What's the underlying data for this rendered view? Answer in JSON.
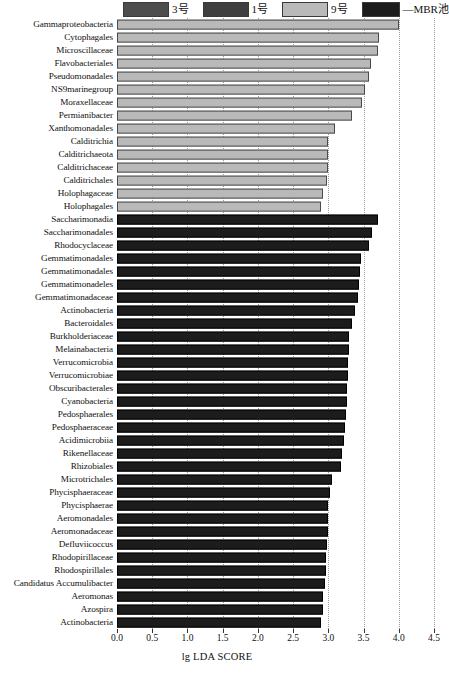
{
  "legend": {
    "items": [
      {
        "label": "3号",
        "color": "#4d4d4d"
      },
      {
        "label": "1号",
        "color": "#3f3f3f"
      },
      {
        "label": "9号",
        "color": "#b9b9b9"
      },
      {
        "label": "—MBR池",
        "color": "#1c1c1c"
      }
    ]
  },
  "axis": {
    "title": "lg LDA SCORE",
    "ticks": [
      "0.0",
      "0.5",
      "1.0",
      "1.5",
      "2.0",
      "2.5",
      "3.0",
      "3.5",
      "4.0",
      "4.5"
    ]
  },
  "footer_artifact": "",
  "chart_data": {
    "type": "bar",
    "orientation": "horizontal",
    "title": "",
    "xlabel": "lg LDA SCORE",
    "ylabel": "",
    "xlim": [
      0.0,
      4.5
    ],
    "grid": true,
    "legend_position": "top",
    "tick_step": 0.5,
    "series": [
      {
        "name": "9号",
        "color": "#b9b9b9"
      },
      {
        "name": "—MBR池",
        "color": "#1c1c1c"
      }
    ],
    "categories": [
      "Gammaproteobacteria",
      "Cytophagales",
      "Microscillaceae",
      "Flavobacteriales",
      "Pseudomonadales",
      "NS9marinegroup",
      "Moraxellaceae",
      "Permianibacter",
      "Xanthomonadales",
      "Calditrichia",
      "Calditrichaeota",
      "Calditrichaceae",
      "Calditrichales",
      "Holophagaceae",
      "Holophagales",
      "Saccharimonadia",
      "Saccharimonadales",
      "Rhodocyclaceae",
      "Gemmatimonadales",
      "Gemmatimonadales",
      "Gemmatimonadeles",
      "Gemmatimonadaceae",
      "Actinobacteria",
      "Bacteroidales",
      "Burkholderiaceae",
      "Melainabacteria",
      "Verrucomicrobia",
      "Verrucomicrobiae",
      "Obscuribacterales",
      "Cyanobacteria",
      "Pedosphaerales",
      "Pedosphaeraceae",
      "Acidimicrobiia",
      "Rikenellaceae",
      "Rhizobiales",
      "Microtrichales",
      "Phycisphaeraceae",
      "Phycisphaerae",
      "Aeromonadales",
      "Aeromonadaceae",
      "Defluviicoccus",
      "Rhodopirillaceae",
      "Rhodospirillales",
      "Candidatus Accumulibacter",
      "Aeromonas",
      "Azospira",
      "Actinobacteria"
    ],
    "values": [
      4.0,
      3.72,
      3.7,
      3.6,
      3.58,
      3.52,
      3.48,
      3.33,
      3.1,
      3.0,
      3.0,
      3.0,
      2.98,
      2.92,
      2.9,
      3.7,
      3.62,
      3.58,
      3.46,
      3.45,
      3.44,
      3.42,
      3.38,
      3.34,
      3.3,
      3.29,
      3.28,
      3.28,
      3.27,
      3.26,
      3.25,
      3.24,
      3.22,
      3.2,
      3.18,
      3.05,
      3.02,
      3.0,
      2.99,
      2.99,
      2.98,
      2.97,
      2.96,
      2.95,
      2.93,
      2.92,
      2.9
    ],
    "group_of": [
      "9号",
      "9号",
      "9号",
      "9号",
      "9号",
      "9号",
      "9号",
      "9号",
      "9号",
      "9号",
      "9号",
      "9号",
      "9号",
      "9号",
      "9号",
      "—MBR池",
      "—MBR池",
      "—MBR池",
      "—MBR池",
      "—MBR池",
      "—MBR池",
      "—MBR池",
      "—MBR池",
      "—MBR池",
      "—MBR池",
      "—MBR池",
      "—MBR池",
      "—MBR池",
      "—MBR池",
      "—MBR池",
      "—MBR池",
      "—MBR池",
      "—MBR池",
      "—MBR池",
      "—MBR池",
      "—MBR池",
      "—MBR池",
      "—MBR池",
      "—MBR池",
      "—MBR池",
      "—MBR池",
      "—MBR池",
      "—MBR池",
      "—MBR池",
      "—MBR池",
      "—MBR池",
      "—MBR池"
    ]
  }
}
